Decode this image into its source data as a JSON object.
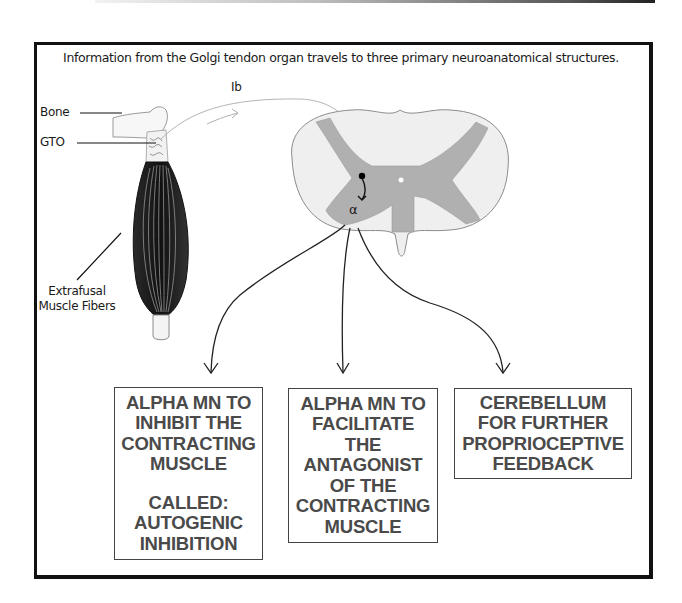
{
  "caption": "Information from the Golgi tendon organ travels to three primary neuroanatomical structures.",
  "labels": {
    "bone": "Bone",
    "gto": "GTO",
    "fiber_line1": "Extrafusal",
    "fiber_line2": "Muscle Fibers",
    "afferent": "Ib",
    "alpha": "α"
  },
  "colors": {
    "frame": "#111111",
    "box_text": "#4a4a4a",
    "white_matter": "#efefef",
    "gray_matter": "#a9a9a9",
    "muscle": "#1c1c1c"
  },
  "targets": [
    {
      "id": "autogenic-inhibition",
      "lines": [
        "ALPHA MN TO",
        "INHIBIT THE",
        "CONTRACTING",
        "MUSCLE"
      ],
      "extra_lines": [
        "CALLED:",
        "AUTOGENIC",
        "INHIBITION"
      ]
    },
    {
      "id": "facilitate-antagonist",
      "lines": [
        "ALPHA MN TO",
        "FACILITATE",
        "THE",
        "ANTAGONIST",
        "OF THE",
        "CONTRACTING",
        "MUSCLE"
      ],
      "extra_lines": []
    },
    {
      "id": "cerebellum",
      "lines": [
        "CEREBELLUM",
        "FOR FURTHER",
        "PROPRIOCEPTIVE",
        "FEEDBACK"
      ],
      "extra_lines": []
    }
  ]
}
